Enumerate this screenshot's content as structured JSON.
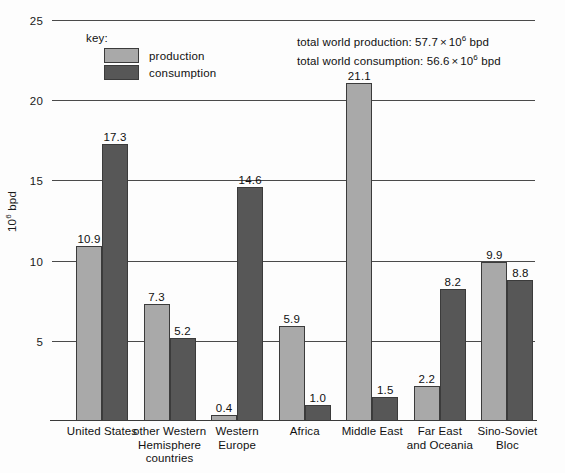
{
  "chart_data": {
    "type": "bar",
    "title": "",
    "xlabel": "",
    "ylabel": "10^6 bpd",
    "ylabel_base": "10",
    "ylabel_exp": "6",
    "ylabel_unit": " bpd",
    "ylim": [
      0,
      25
    ],
    "yticks": [
      5,
      10,
      15,
      20,
      25
    ],
    "ytick_labels": [
      "5",
      "10",
      "15",
      "20",
      "25"
    ],
    "grid": true,
    "legend_position": "top-left",
    "categories": [
      "United States",
      "other Western Hemisphere countries",
      "Western Europe",
      "Africa",
      "Middle East",
      "Far East and Oceania",
      "Sino-Soviet Bloc"
    ],
    "category_lines": [
      [
        "United States"
      ],
      [
        "other Western",
        "Hemisphere",
        "countries"
      ],
      [
        "Western",
        "Europe"
      ],
      [
        "Africa"
      ],
      [
        "Middle East"
      ],
      [
        "Far East",
        "and Oceania"
      ],
      [
        "Sino-Soviet",
        "Bloc"
      ]
    ],
    "series": [
      {
        "name": "production",
        "color": "#a9a9a9",
        "values": [
          10.9,
          7.3,
          0.4,
          5.9,
          21.1,
          2.2,
          9.9
        ],
        "labels": [
          "10.9",
          "7.3",
          "0.4",
          "5.9",
          "21.1",
          "2.2",
          "9.9"
        ]
      },
      {
        "name": "consumption",
        "color": "#575757",
        "values": [
          17.3,
          5.2,
          14.6,
          1.0,
          1.5,
          8.2,
          8.8
        ],
        "labels": [
          "17.3",
          "5.2",
          "14.6",
          "1.0",
          "1.5",
          "8.2",
          "8.8"
        ]
      }
    ]
  },
  "legend": {
    "title": "key:",
    "items": [
      {
        "label": "production",
        "color": "#a9a9a9"
      },
      {
        "label": "consumption",
        "color": "#575757"
      }
    ]
  },
  "annotations": {
    "production_total": {
      "prefix": "total world production: 57.7",
      "times": "×",
      "base": "10",
      "exp": "6",
      "suffix": " bpd"
    },
    "consumption_total": {
      "prefix": "total world consumption: 56.6",
      "times": "×",
      "base": "10",
      "exp": "6",
      "suffix": " bpd"
    }
  }
}
